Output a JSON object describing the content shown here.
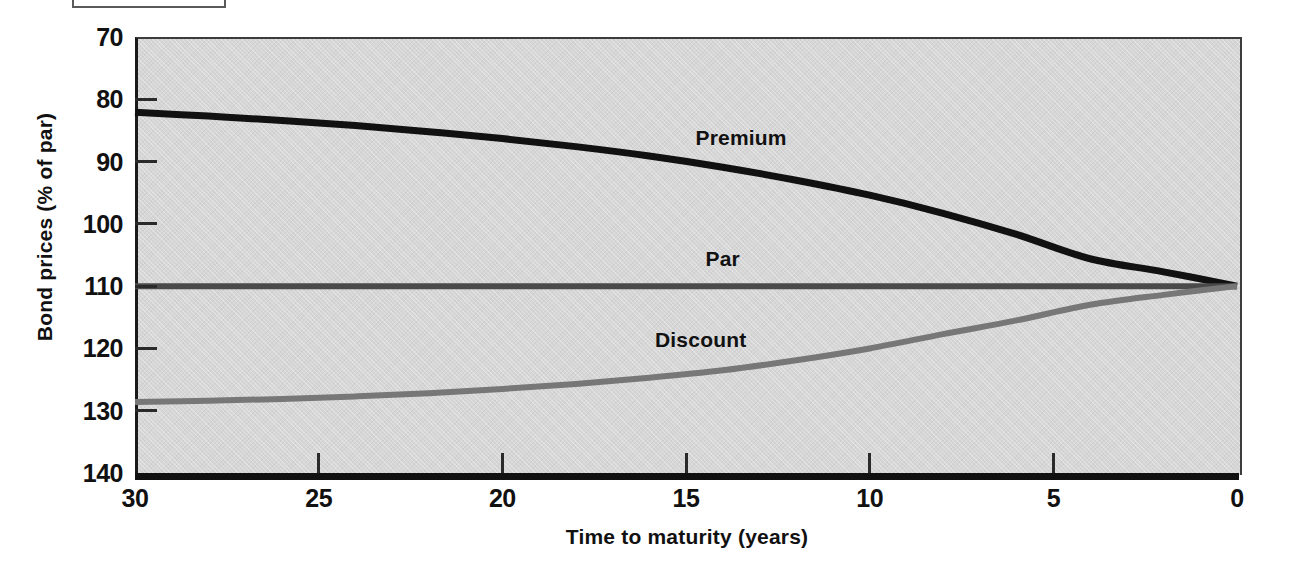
{
  "figure": {
    "caption_box": "",
    "background_color": "#d6d6d6",
    "axis_color": "#111111"
  },
  "axes": {
    "y_title": "Bond prices (% of par)",
    "x_title": "Time to maturity (years)",
    "y_ticks": [
      "140",
      "130",
      "120",
      "110",
      "100",
      "90",
      "80",
      "70"
    ],
    "x_ticks": [
      "30",
      "25",
      "20",
      "15",
      "10",
      "5",
      "0"
    ]
  },
  "series_labels": {
    "premium": "Premium",
    "par": "Par",
    "discount": "Discount"
  },
  "colors": {
    "premium": "#111111",
    "par": "#4a4a4a",
    "discount": "#777777",
    "panel": "#d6d6d6"
  },
  "chart_data": {
    "type": "line",
    "title": "",
    "subtitle": "",
    "xlabel": "Time to maturity (years)",
    "ylabel": "Bond prices (% of par)",
    "xlim": [
      30,
      0
    ],
    "ylim": [
      70,
      140
    ],
    "x_ticks": [
      30,
      25,
      20,
      15,
      10,
      5,
      0
    ],
    "y_ticks": [
      70,
      80,
      90,
      100,
      110,
      120,
      130,
      140
    ],
    "x_reversed": true,
    "grid": false,
    "legend": "inline-annotations",
    "x": [
      30,
      28,
      26,
      24,
      22,
      20,
      18,
      16,
      14,
      12,
      10,
      8,
      6,
      4,
      2,
      0
    ],
    "series": [
      {
        "name": "Premium",
        "color": "#111111",
        "annotation": "Premium",
        "annotation_x": 13.5,
        "annotation_y": 123.5,
        "values": [
          127.9,
          127.3,
          126.6,
          125.8,
          124.8,
          123.7,
          122.4,
          120.9,
          119.1,
          117.0,
          114.6,
          111.7,
          108.3,
          104.4,
          102.3,
          100.0
        ]
      },
      {
        "name": "Par",
        "color": "#4a4a4a",
        "annotation": "Par",
        "annotation_x": 14.0,
        "annotation_y": 104.0,
        "values": [
          100.0,
          100.0,
          100.0,
          100.0,
          100.0,
          100.0,
          100.0,
          100.0,
          100.0,
          100.0,
          100.0,
          100.0,
          100.0,
          100.0,
          100.0,
          100.0
        ]
      },
      {
        "name": "Discount",
        "color": "#777777",
        "annotation": "Discount",
        "annotation_x": 14.6,
        "annotation_y": 91.0,
        "values": [
          81.4,
          81.6,
          81.9,
          82.3,
          82.8,
          83.5,
          84.3,
          85.3,
          86.5,
          88.1,
          90.0,
          92.3,
          94.5,
          97.0,
          98.6,
          100.0
        ]
      }
    ]
  }
}
